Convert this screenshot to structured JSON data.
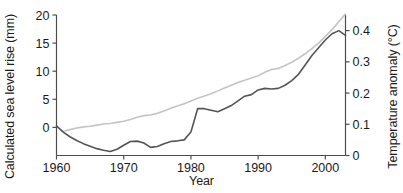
{
  "chart_data": {
    "type": "line",
    "title": "",
    "xlabel": "Year",
    "ylabel": "Calculated sea level rise (mm)",
    "ylabel_right": "Temperature anomaly (°C)",
    "xlim": [
      1960,
      2003
    ],
    "ylim": [
      -5,
      20
    ],
    "ylim_right": [
      0.0,
      0.45
    ],
    "grid": false,
    "legend": "none",
    "xticks": [
      "1960",
      "1970",
      "1980",
      "1990",
      "2000"
    ],
    "xtick_values": [
      1960,
      1970,
      1980,
      1990,
      2000
    ],
    "yticks": [
      "0",
      "5",
      "10",
      "15",
      "20"
    ],
    "ytick_values": [
      0,
      5,
      10,
      15,
      20
    ],
    "yticks_right": [
      "0",
      "0.1",
      "0.2",
      "0.3",
      "0.4"
    ],
    "ytick_values_right": [
      0,
      0.1,
      0.2,
      0.3,
      0.4
    ],
    "x": [
      1960,
      1961,
      1962,
      1963,
      1964,
      1965,
      1966,
      1967,
      1968,
      1969,
      1970,
      1971,
      1972,
      1973,
      1974,
      1975,
      1976,
      1977,
      1978,
      1979,
      1980,
      1981,
      1982,
      1983,
      1984,
      1985,
      1986,
      1987,
      1988,
      1989,
      1990,
      1991,
      1992,
      1993,
      1994,
      1995,
      1996,
      1997,
      1998,
      1999,
      2000,
      2001,
      2002,
      2003
    ],
    "series": [
      {
        "name": "Calculated sea level rise",
        "axis": "left",
        "color": "#c4c4c4",
        "units": "mm",
        "values": [
          null,
          -0.7,
          -0.4,
          -0.1,
          0.1,
          0.2,
          0.4,
          0.6,
          0.7,
          0.9,
          1.1,
          1.4,
          1.8,
          2.1,
          2.2,
          2.5,
          2.9,
          3.4,
          3.8,
          4.2,
          4.7,
          5.2,
          5.6,
          6.0,
          6.5,
          7.0,
          7.5,
          8.0,
          8.4,
          8.8,
          9.2,
          9.8,
          10.3,
          10.5,
          11.0,
          11.6,
          12.3,
          13.1,
          14.0,
          15.0,
          16.2,
          17.4,
          18.8,
          20.2
        ]
      },
      {
        "name": "Temperature anomaly",
        "axis": "right",
        "color": "#555555",
        "units": "°C",
        "values": [
          0.095,
          0.075,
          0.06,
          0.048,
          0.038,
          0.03,
          0.022,
          0.017,
          0.013,
          0.02,
          0.033,
          0.045,
          0.046,
          0.04,
          0.026,
          0.029,
          0.038,
          0.045,
          0.047,
          0.05,
          0.075,
          0.15,
          0.15,
          0.145,
          0.14,
          0.15,
          0.16,
          0.175,
          0.19,
          0.195,
          0.21,
          0.215,
          0.213,
          0.215,
          0.225,
          0.24,
          0.26,
          0.29,
          0.32,
          0.345,
          0.37,
          0.39,
          0.4,
          0.385
        ]
      }
    ]
  },
  "axes": {
    "left_title": "Calculated sea level rise (mm)",
    "right_title": "Temperature anomaly (°C)",
    "bottom_title": "Year"
  },
  "colors": {
    "sea_level_line": "#c4c4c4",
    "temperature_line": "#555555",
    "axis": "#4d4d4d",
    "text": "#1a1a1a"
  }
}
